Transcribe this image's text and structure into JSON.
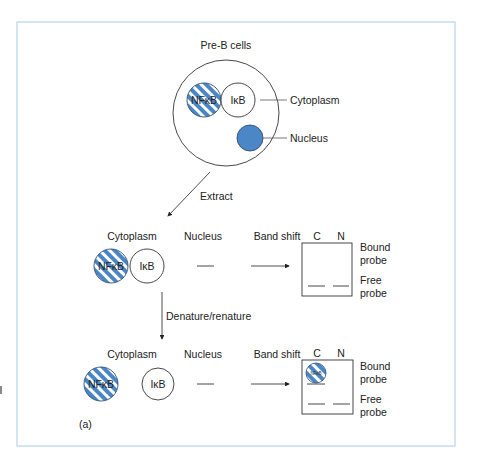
{
  "figure": {
    "panel_label": "(a)",
    "colors": {
      "frame": "#b9d3ea",
      "stripe_blue": "#4a86c5",
      "nucleus_fill": "#4b87c7",
      "stroke": "#333333",
      "text": "#222222"
    },
    "top": {
      "title": "Pre-B cells",
      "nfkb_label": "NFκB",
      "ikb_label": "IκB",
      "cytoplasm_label": "Cytoplasm",
      "nucleus_label": "Nucleus"
    },
    "extract_step": {
      "label": "Extract"
    },
    "row1": {
      "cytoplasm_header": "Cytoplasm",
      "nucleus_header": "Nucleus",
      "bandshift_header": "Band shift",
      "lane_c": "C",
      "lane_n": "N",
      "nfkb_label": "NFκB",
      "ikb_label": "IκB",
      "bound_label_1": "Bound",
      "bound_label_2": "probe",
      "free_label_1": "Free",
      "free_label_2": "probe"
    },
    "denature_step": {
      "label": "Denature/renature"
    },
    "row2": {
      "cytoplasm_header": "Cytoplasm",
      "nucleus_header": "Nucleus",
      "bandshift_header": "Band shift",
      "lane_c": "C",
      "lane_n": "N",
      "nfkb_label": "NFκB",
      "ikb_label": "IκB",
      "band_nfkb_label": "NFκB",
      "bound_label_1": "Bound",
      "bound_label_2": "probe",
      "free_label_1": "Free",
      "free_label_2": "probe"
    }
  }
}
